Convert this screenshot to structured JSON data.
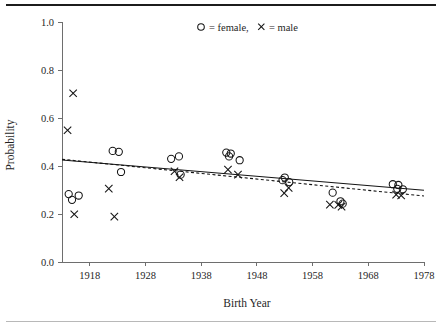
{
  "chart_data": {
    "type": "scatter",
    "title": "",
    "xlabel": "Birth Year",
    "ylabel": "Probability",
    "xlim": [
      1913,
      1978
    ],
    "ylim": [
      0.0,
      1.0
    ],
    "xticks": [
      1918,
      1928,
      1938,
      1948,
      1958,
      1968,
      1978
    ],
    "xticklabels": [
      "1918",
      "1928",
      "1938",
      "1948",
      "1958",
      "1968",
      "1978"
    ],
    "yticks": [
      0.0,
      0.2,
      0.4,
      0.6,
      0.8,
      1.0
    ],
    "yticklabels": [
      "0.0",
      "0.2",
      "0.4",
      "0.6",
      "0.8",
      "1.0"
    ],
    "grid": false,
    "legend": {
      "position": "top-center",
      "text": "= female,",
      "text2": "= male",
      "female_symbol": "circle",
      "male_symbol": "cross",
      "entries": [
        {
          "label": "female",
          "symbol": "circle"
        },
        {
          "label": "male",
          "symbol": "cross"
        }
      ]
    },
    "series": [
      {
        "name": "female",
        "symbol": "circle",
        "points": [
          {
            "x": 1914.2,
            "y": 0.283
          },
          {
            "x": 1914.8,
            "y": 0.259
          },
          {
            "x": 1916.0,
            "y": 0.277
          },
          {
            "x": 1922.1,
            "y": 0.463
          },
          {
            "x": 1923.2,
            "y": 0.459
          },
          {
            "x": 1923.6,
            "y": 0.375
          },
          {
            "x": 1932.6,
            "y": 0.43
          },
          {
            "x": 1934.0,
            "y": 0.44
          },
          {
            "x": 1934.3,
            "y": 0.364
          },
          {
            "x": 1942.5,
            "y": 0.456
          },
          {
            "x": 1943.3,
            "y": 0.452
          },
          {
            "x": 1943.0,
            "y": 0.44
          },
          {
            "x": 1944.9,
            "y": 0.424
          },
          {
            "x": 1953.0,
            "y": 0.352
          },
          {
            "x": 1952.6,
            "y": 0.341
          },
          {
            "x": 1953.8,
            "y": 0.333
          },
          {
            "x": 1961.6,
            "y": 0.289
          },
          {
            "x": 1963.0,
            "y": 0.253
          },
          {
            "x": 1963.4,
            "y": 0.243
          },
          {
            "x": 1972.4,
            "y": 0.324
          },
          {
            "x": 1973.4,
            "y": 0.321
          },
          {
            "x": 1973.2,
            "y": 0.305
          },
          {
            "x": 1974.2,
            "y": 0.303
          }
        ]
      },
      {
        "name": "male",
        "symbol": "cross",
        "points": [
          {
            "x": 1915.0,
            "y": 0.703
          },
          {
            "x": 1914.0,
            "y": 0.549
          },
          {
            "x": 1915.2,
            "y": 0.199
          },
          {
            "x": 1921.4,
            "y": 0.306
          },
          {
            "x": 1922.4,
            "y": 0.189
          },
          {
            "x": 1933.2,
            "y": 0.378
          },
          {
            "x": 1934.1,
            "y": 0.353
          },
          {
            "x": 1942.8,
            "y": 0.385
          },
          {
            "x": 1944.6,
            "y": 0.364
          },
          {
            "x": 1952.9,
            "y": 0.287
          },
          {
            "x": 1953.7,
            "y": 0.309
          },
          {
            "x": 1961.1,
            "y": 0.239
          },
          {
            "x": 1962.6,
            "y": 0.238
          },
          {
            "x": 1963.2,
            "y": 0.231
          },
          {
            "x": 1973.0,
            "y": 0.281
          },
          {
            "x": 1973.9,
            "y": 0.277
          }
        ]
      }
    ],
    "fits": [
      {
        "name": "female-fit",
        "style": "solid",
        "x0": 1913.0,
        "y0": 0.425,
        "x1": 1978.0,
        "y1": 0.299
      },
      {
        "name": "male-fit",
        "style": "dashed",
        "x0": 1913.0,
        "y0": 0.428,
        "x1": 1978.0,
        "y1": 0.275
      }
    ]
  }
}
